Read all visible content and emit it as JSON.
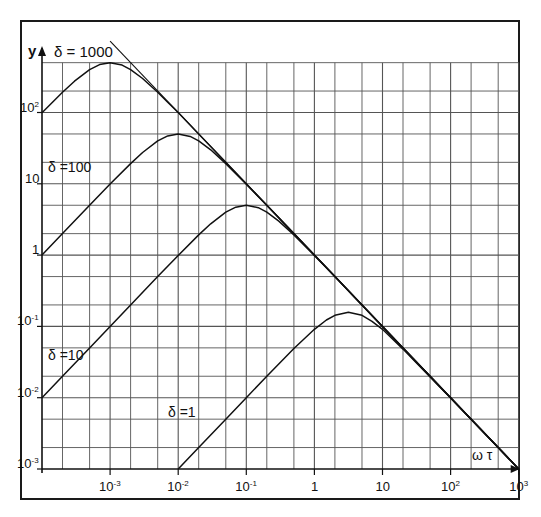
{
  "chart_data": {
    "type": "line",
    "title": "",
    "xlabel": "ω τ",
    "ylabel": "y",
    "xscale": "log",
    "yscale": "log",
    "xlim": [
      0.0001,
      1000
    ],
    "ylim": [
      0.001,
      500
    ],
    "grid": true,
    "grid_minor_ticks": [
      2,
      5
    ],
    "legend": "inline labels",
    "x_ticks": [
      {
        "value": 0.001,
        "base": "10",
        "exp": "-3"
      },
      {
        "value": 0.01,
        "base": "10",
        "exp": "-2"
      },
      {
        "value": 0.1,
        "base": "10",
        "exp": "-1"
      },
      {
        "value": 1,
        "base": "1",
        "exp": ""
      },
      {
        "value": 10,
        "base": "10",
        "exp": ""
      },
      {
        "value": 100,
        "base": "10",
        "exp": "2"
      },
      {
        "value": 1000,
        "base": "10",
        "exp": "3"
      }
    ],
    "y_ticks": [
      {
        "value": 0.001,
        "base": "10",
        "exp": "-3"
      },
      {
        "value": 0.01,
        "base": "10",
        "exp": "-2"
      },
      {
        "value": 0.1,
        "base": "10",
        "exp": "-1"
      },
      {
        "value": 1,
        "base": "1",
        "exp": ""
      },
      {
        "value": 10,
        "base": "10",
        "exp": ""
      },
      {
        "value": 100,
        "base": "10",
        "exp": "2"
      }
    ],
    "series": [
      {
        "name": "δ = 1000",
        "label": "δ = 1000",
        "peak": {
          "x": 0.001,
          "y": 500
        },
        "x": [
          0.0001,
          0.0002,
          0.0003,
          0.0005,
          0.0007,
          0.001,
          0.0015,
          0.002,
          0.003,
          0.005,
          0.007,
          0.01,
          0.02,
          0.05,
          0.1,
          0.2,
          0.5,
          1,
          2,
          5,
          10,
          20,
          50,
          100,
          200,
          500,
          1000
        ],
        "values": [
          99,
          192,
          275,
          400,
          470,
          500,
          462,
          400,
          300,
          192,
          140,
          99.9,
          50,
          20,
          10,
          5,
          2,
          1,
          0.5,
          0.2,
          0.1,
          0.05,
          0.02,
          0.01,
          0.005,
          0.002,
          0.001
        ]
      },
      {
        "name": "δ = 100",
        "label": "δ = 100",
        "peak": {
          "x": 0.01,
          "y": 50
        },
        "x": [
          0.0001,
          0.0002,
          0.0005,
          0.001,
          0.002,
          0.003,
          0.005,
          0.007,
          0.01,
          0.015,
          0.02,
          0.03,
          0.05,
          0.1,
          0.2,
          0.5,
          1,
          2,
          5,
          10,
          20,
          50,
          100,
          200,
          500,
          1000
        ],
        "values": [
          1,
          2,
          5,
          9.9,
          19.2,
          27.5,
          40,
          47,
          50,
          46.2,
          40,
          30,
          19.2,
          9.9,
          5,
          2,
          1,
          0.5,
          0.2,
          0.1,
          0.05,
          0.02,
          0.01,
          0.005,
          0.002,
          0.001
        ]
      },
      {
        "name": "δ = 10",
        "label": "δ = 10",
        "peak": {
          "x": 0.1,
          "y": 5
        },
        "x": [
          0.0001,
          0.0002,
          0.0005,
          0.001,
          0.002,
          0.005,
          0.01,
          0.02,
          0.03,
          0.05,
          0.07,
          0.1,
          0.15,
          0.2,
          0.3,
          0.5,
          1,
          2,
          5,
          10,
          20,
          50,
          100,
          200,
          500,
          1000
        ],
        "values": [
          0.01,
          0.02,
          0.05,
          0.1,
          0.2,
          0.5,
          0.99,
          1.92,
          2.75,
          4,
          4.7,
          5,
          4.62,
          4,
          3,
          1.92,
          0.99,
          0.5,
          0.2,
          0.1,
          0.05,
          0.02,
          0.01,
          0.005,
          0.002,
          0.001
        ]
      },
      {
        "name": "δ = 1",
        "label": "δ = 1",
        "peak": {
          "x": 3.16,
          "y": 0.158
        },
        "x": [
          0.01,
          0.02,
          0.05,
          0.1,
          0.2,
          0.5,
          1,
          1.5,
          2,
          3.16,
          5,
          7,
          10,
          20,
          50,
          100,
          200,
          500,
          1000
        ],
        "values": [
          0.001,
          0.002,
          0.005,
          0.01,
          0.02,
          0.049,
          0.091,
          0.123,
          0.143,
          0.158,
          0.143,
          0.118,
          0.091,
          0.048,
          0.0196,
          0.0099,
          0.005,
          0.002,
          0.001
        ]
      }
    ],
    "asymptote": {
      "name": "1/ωτ",
      "x": [
        0.001,
        1000
      ],
      "values": [
        1000,
        0.001
      ]
    }
  },
  "labels": {
    "y_axis": "y",
    "x_axis": "ω τ",
    "delta_1000": "δ = 1000",
    "delta_100": "δ =100",
    "delta_10": "δ =10",
    "delta_1": "δ =1"
  },
  "colors": {
    "line": "#111111",
    "grid": "#555555",
    "frame": "#1a1a1a",
    "background": "#ffffff"
  }
}
